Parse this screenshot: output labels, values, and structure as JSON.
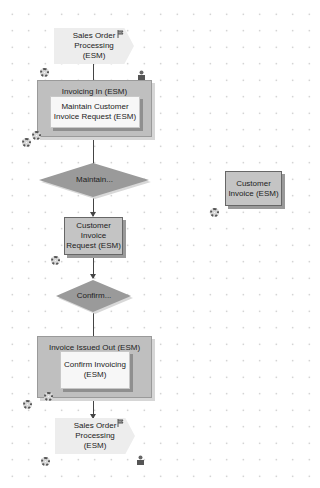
{
  "diagram": {
    "nodes": {
      "start_process": {
        "label_lines": [
          "Sales Order",
          "Processing",
          "(ESM)"
        ]
      },
      "invoicing_in": {
        "title": "Invoicing In (ESM)",
        "inner_label_lines": [
          "Maintain Customer",
          "Invoice Request (ESM)"
        ]
      },
      "decision_maintain": {
        "label": "Maintain..."
      },
      "customer_invoice_request": {
        "label_lines": [
          "Customer",
          "Invoice",
          "Request (ESM)"
        ]
      },
      "decision_confirm": {
        "label": "Confirm..."
      },
      "invoice_issued_out": {
        "title": "Invoice Issued Out (ESM)",
        "inner_label_lines": [
          "Confirm Invoicing",
          "(ESM)"
        ]
      },
      "end_process": {
        "label_lines": [
          "Sales Order",
          "Processing",
          "(ESM)"
        ]
      },
      "customer_invoice": {
        "label_lines": [
          "Customer",
          "Invoice (ESM)"
        ]
      }
    },
    "colors": {
      "background": "#ffffff",
      "grid_dot": "#b8b8b8",
      "process_fill": "#ededed",
      "container_fill": "#bfbfbf",
      "inner_fill": "#f7f7f7",
      "object_fill": "#c4c4c4",
      "decision_fill": "#9a9a9a",
      "connector": "#444444"
    }
  }
}
